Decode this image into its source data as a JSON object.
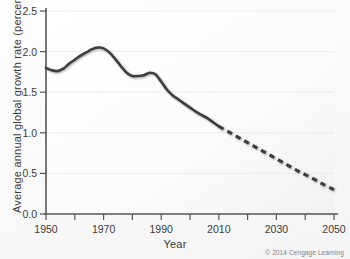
{
  "chart_data": {
    "type": "line",
    "title": "",
    "subtitle": "",
    "xlabel": "Year",
    "ylabel": "Average annual global growth rate (percent)",
    "xlim": [
      1950,
      2050
    ],
    "ylim": [
      0.0,
      2.5
    ],
    "xticks": [
      1950,
      1960,
      1970,
      1980,
      1990,
      2000,
      2010,
      2020,
      2030,
      2040,
      2050
    ],
    "xtick_labels": [
      "1950",
      "",
      "1970",
      "",
      "1990",
      "",
      "2010",
      "",
      "2030",
      "",
      "2050"
    ],
    "yticks": [
      0.0,
      0.5,
      1.0,
      1.5,
      2.0,
      2.5
    ],
    "ytick_labels": [
      "0.0",
      "0.5",
      "1.0",
      "1.5",
      "2.0",
      "2.5"
    ],
    "grid": true,
    "legend": "none",
    "line_color": "#3d3d3d",
    "series": [
      {
        "name": "Observed average annual global growth rate",
        "style": "solid",
        "x": [
          1950,
          1952,
          1954,
          1956,
          1958,
          1960,
          1962,
          1964,
          1966,
          1968,
          1970,
          1972,
          1974,
          1976,
          1978,
          1980,
          1982,
          1984,
          1986,
          1988,
          1990,
          1992,
          1994,
          1996,
          1998,
          2000,
          2002,
          2004,
          2006,
          2008,
          2010
        ],
        "values": [
          1.8,
          1.77,
          1.76,
          1.79,
          1.85,
          1.9,
          1.95,
          1.99,
          2.03,
          2.05,
          2.04,
          1.99,
          1.91,
          1.82,
          1.74,
          1.7,
          1.7,
          1.71,
          1.74,
          1.72,
          1.63,
          1.53,
          1.46,
          1.41,
          1.36,
          1.31,
          1.26,
          1.22,
          1.18,
          1.13,
          1.08
        ]
      },
      {
        "name": "Projected average annual global growth rate",
        "style": "dashed",
        "x": [
          2010,
          2014,
          2018,
          2022,
          2026,
          2030,
          2034,
          2038,
          2042,
          2046,
          2050
        ],
        "values": [
          1.08,
          1.0,
          0.92,
          0.84,
          0.76,
          0.68,
          0.6,
          0.52,
          0.45,
          0.37,
          0.3
        ]
      }
    ]
  },
  "axes": {
    "x_title": "Year",
    "y_title": "Average annual global growth rate (percent)"
  },
  "footer": {
    "copyright": "© 2014 Cengage Learning"
  }
}
